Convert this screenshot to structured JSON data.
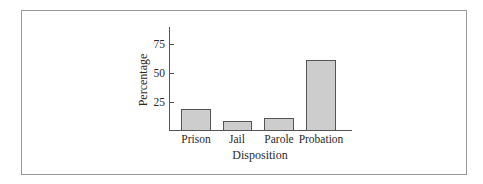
{
  "chart_data": {
    "type": "bar",
    "title": "",
    "xlabel": "Disposition",
    "ylabel": "Percentage",
    "categories": [
      "Prison",
      "Jail",
      "Parole",
      "Probation"
    ],
    "values": [
      19,
      9,
      11,
      61
    ],
    "yticks": [
      25,
      50,
      75
    ],
    "ylim": [
      0,
      90
    ],
    "grid": false,
    "legend": null,
    "bar_color": "#cdcdcd",
    "bar_edge_color": "#555555"
  }
}
